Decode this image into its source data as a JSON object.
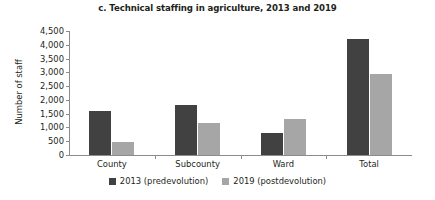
{
  "chart_data": {
    "type": "bar",
    "title": "c. Technical staffing in agriculture, 2013 and 2019",
    "xlabel": "",
    "ylabel": "Number of staff",
    "categories": [
      "County",
      "Subcounty",
      "Ward",
      "Total"
    ],
    "series": [
      {
        "name": "2013 (predevolution)",
        "color": "#414141",
        "values": [
          1580,
          1800,
          800,
          4200
        ]
      },
      {
        "name": "2019 (postdevolution)",
        "color": "#a6a6a6",
        "values": [
          460,
          1150,
          1300,
          2950
        ]
      }
    ],
    "ylim": [
      0,
      4500
    ],
    "ytick_step": 500,
    "ytick_labels": [
      "0",
      "500",
      "1,000",
      "1,500",
      "2,000",
      "2,500",
      "3,000",
      "3,500",
      "4,000",
      "4,500"
    ],
    "ytick_values": [
      0,
      500,
      1000,
      1500,
      2000,
      2500,
      3000,
      3500,
      4000,
      4500
    ],
    "grid": false,
    "legend_position": "bottom-center"
  }
}
